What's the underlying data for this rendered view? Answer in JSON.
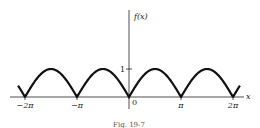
{
  "chart_data": {
    "type": "line",
    "function": "|sin x|",
    "title": "",
    "xlabel": "x",
    "ylabel": "f(x)",
    "x_ticks": [
      {
        "value": -6.2832,
        "label": "-2π"
      },
      {
        "value": -3.1416,
        "label": "-π"
      },
      {
        "value": 0,
        "label": "0"
      },
      {
        "value": 3.1416,
        "label": "π"
      },
      {
        "value": 6.2832,
        "label": "2π"
      }
    ],
    "y_ticks": [
      {
        "value": 1,
        "label": "1"
      }
    ],
    "xlim": [
      -6.6,
      6.6
    ],
    "ylim": [
      0,
      1
    ],
    "grid": false,
    "legend": null,
    "series": [
      {
        "name": "f(x)",
        "x": [
          -6.7,
          -6.2832,
          -5.4978,
          -4.7124,
          -3.927,
          -3.1416,
          -2.3562,
          -1.5708,
          -0.7854,
          0,
          0.7854,
          1.5708,
          2.3562,
          3.1416,
          3.927,
          4.7124,
          5.4978,
          6.2832,
          6.7
        ],
        "values": [
          0.4,
          0,
          0.707,
          1,
          0.707,
          0,
          0.707,
          1,
          0.707,
          0,
          0.707,
          1,
          0.707,
          0,
          0.707,
          1,
          0.707,
          0,
          0.4
        ]
      }
    ]
  },
  "labels": {
    "y_axis": "f(x)",
    "x_axis": "x",
    "y_one": "1",
    "origin": "0",
    "neg_two_pi": "−2π",
    "neg_pi": "−π",
    "pi": "π",
    "two_pi": "2π",
    "caption": "Fig. 19-7"
  }
}
